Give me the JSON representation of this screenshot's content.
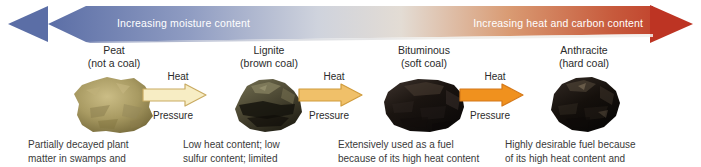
{
  "banner": {
    "left_label": "Increasing moisture content",
    "right_label": "Increasing heat and carbon content",
    "left_color": "#5b6ea6",
    "mid_color": "#e8e4e0",
    "right_color": "#c1392b",
    "left_arrow_icon": "left-arrow-icon",
    "right_arrow_icon": "right-arrow-icon"
  },
  "stages": [
    {
      "name": "Peat",
      "qualifier": "(not a coal)",
      "specimen_icon": "peat-specimen",
      "specimen_color": "#a89a62",
      "caption_line1": "Partially decayed plant",
      "caption_line2": "matter in swamps and"
    },
    {
      "name": "Lignite",
      "qualifier": "(brown coal)",
      "specimen_icon": "lignite-specimen",
      "specimen_color": "#4a4632",
      "caption_line1": "Low heat content; low",
      "caption_line2": "sulfur content; limited"
    },
    {
      "name": "Bituminous",
      "qualifier": "(soft coal)",
      "specimen_icon": "bituminous-specimen",
      "specimen_color": "#1a1410",
      "caption_line1": "Extensively used as a fuel",
      "caption_line2": "because of its high heat content"
    },
    {
      "name": "Anthracite",
      "qualifier": "(hard coal)",
      "specimen_icon": "anthracite-specimen",
      "specimen_color": "#15100c",
      "caption_line1": "Highly desirable fuel because",
      "caption_line2": "of its high heat content and"
    }
  ],
  "transitions": [
    {
      "top_label": "Heat",
      "bottom_label": "Pressure",
      "arrow_icon": "right-arrow-icon",
      "fill": "#f7edc4",
      "stroke": "#c9ab63"
    },
    {
      "top_label": "Heat",
      "bottom_label": "Pressure",
      "arrow_icon": "right-arrow-icon",
      "fill": "#f0c069",
      "stroke": "#d09c3d"
    },
    {
      "top_label": "Heat",
      "bottom_label": "Pressure",
      "arrow_icon": "right-arrow-icon",
      "fill": "#f0911e",
      "stroke": "#d4791a"
    }
  ]
}
